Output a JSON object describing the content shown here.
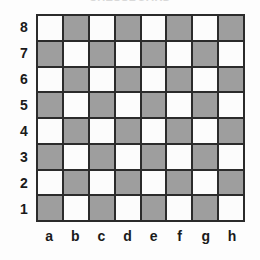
{
  "title": {
    "text": "CHESSBOARD"
  },
  "board": {
    "rank_labels": [
      "8",
      "7",
      "6",
      "5",
      "4",
      "3",
      "2",
      "1"
    ],
    "file_labels": [
      "a",
      "b",
      "c",
      "d",
      "e",
      "f",
      "g",
      "h"
    ],
    "light_color": "#fcfcfc",
    "dark_color": "#9e9e9e",
    "line_color": "#2b2b2b",
    "background_color": "#fdfdfd",
    "label_color": "#1a1a1a",
    "rows": 8,
    "cols": 8,
    "square_colors": [
      [
        "light",
        "dark",
        "light",
        "dark",
        "light",
        "dark",
        "light",
        "dark"
      ],
      [
        "dark",
        "light",
        "dark",
        "light",
        "dark",
        "light",
        "dark",
        "light"
      ],
      [
        "light",
        "dark",
        "light",
        "dark",
        "light",
        "dark",
        "light",
        "dark"
      ],
      [
        "dark",
        "light",
        "dark",
        "light",
        "dark",
        "light",
        "dark",
        "light"
      ],
      [
        "light",
        "dark",
        "light",
        "dark",
        "light",
        "dark",
        "light",
        "dark"
      ],
      [
        "dark",
        "light",
        "dark",
        "light",
        "dark",
        "light",
        "dark",
        "light"
      ],
      [
        "light",
        "dark",
        "light",
        "dark",
        "light",
        "dark",
        "light",
        "dark"
      ],
      [
        "dark",
        "light",
        "dark",
        "light",
        "dark",
        "light",
        "dark",
        "light"
      ]
    ]
  }
}
